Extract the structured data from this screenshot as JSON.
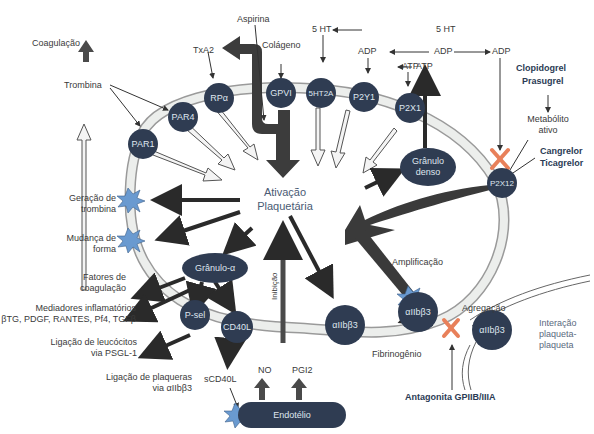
{
  "diagram": {
    "center_label": [
      "Ativação",
      "Plaquetária"
    ],
    "colors": {
      "node_fill": "#2f3c52",
      "node_text": "#dfe6ef",
      "membrane": "#e8ebe8",
      "dark_arrow": "#3a3a3a",
      "star": "#6a9ad0",
      "inhibit_x": "#e8805a",
      "drug_text": "#2b3b55"
    },
    "receptors": [
      {
        "id": "par1",
        "label": "PAR1"
      },
      {
        "id": "par4",
        "label": "PAR4"
      },
      {
        "id": "rpa",
        "label": "RPα"
      },
      {
        "id": "gpvi",
        "label": "GPVI"
      },
      {
        "id": "5ht2a",
        "label": "5HT2A"
      },
      {
        "id": "p2y1",
        "label": "P2Y1"
      },
      {
        "id": "p2x1",
        "label": "P2X1"
      },
      {
        "id": "p2x12",
        "label": "P2X12"
      }
    ],
    "granules": {
      "dense": [
        "Grânulo",
        "denso"
      ],
      "alpha": "Grânulo-α"
    },
    "surface": {
      "psel": "P-sel",
      "cd40l": "CD40L",
      "aiib_left": "αIIbβ3",
      "aiib_right": "αIIbβ3",
      "aiib_other": "αIIbβ3",
      "endotelio": "Endotélio"
    },
    "agonists": {
      "coagulacao": "Coagulação",
      "trombina": "Trombina",
      "txa2": "TxA2",
      "aspirina": "Aspirina",
      "colageno": "Colágeno",
      "5ht_a": "5 HT",
      "5ht_b": "5 HT",
      "adp_a": "ADP",
      "adp_b": "ADP",
      "adp_c": "ADP",
      "atp_a": "ATP",
      "atp_b": "ATP"
    },
    "drugs": {
      "clopidogrel": "Clopidogrel",
      "prasugrel": "Prasugrel",
      "metabolito": [
        "Metabólito",
        "ativo"
      ],
      "cangrelor": "Cangrelor",
      "ticagrelor": "Ticagrelor",
      "antagonista": "Antagonita GPIIB/IIIA"
    },
    "effects": {
      "geracao": [
        "Geração de",
        "trombina"
      ],
      "mudanca": [
        "Mudança de",
        "forma"
      ],
      "fatores": [
        "Fatores de",
        "coagulação"
      ],
      "mediadores": [
        "Mediadores inflamatórios",
        "βTG, PDGF, RANTES, Pf4, TGFβ"
      ],
      "leucocitos": [
        "Ligação de leucócitos",
        "via PSGL-1"
      ],
      "plaquetas": [
        "Ligação de plaqueras",
        "via αIIbβ3"
      ],
      "scd40l": "sCD40L",
      "inibicao": "Inibição",
      "no": "NO",
      "pgi2": "PGI2",
      "fibrinogenio": "Fibrinogênio",
      "amplificacao": "Amplificação",
      "agregacao": "Agregação",
      "interacao": [
        "Interação",
        "plaqueta-",
        "plaqueta"
      ]
    }
  }
}
